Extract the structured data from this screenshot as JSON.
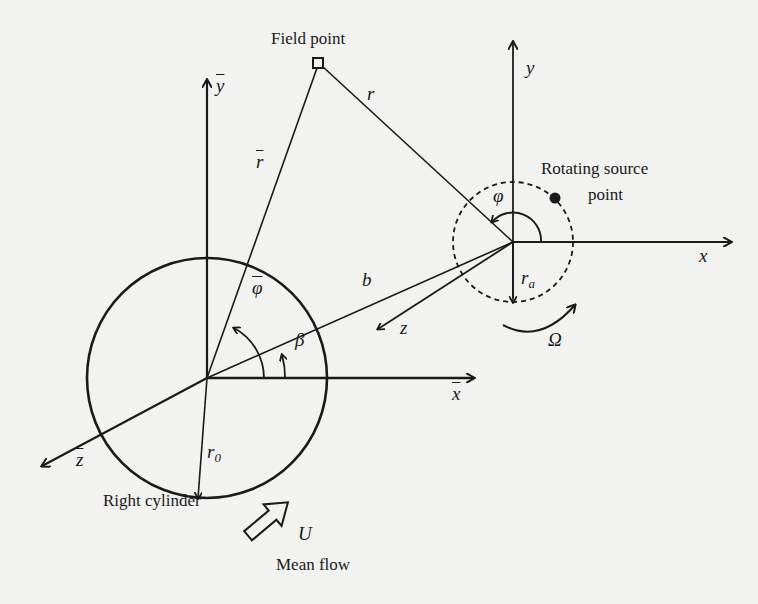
{
  "figure": {
    "type": "geometry-diagram",
    "labels": {
      "field_point": "Field point",
      "rotating_source_line1": "Rotating source",
      "rotating_source_line2": "point",
      "right_cylinder": "Right cylinder",
      "mean_flow": "Mean flow",
      "y_bar": "y",
      "x_bar": "x",
      "z_bar": "z",
      "r_bar": "r",
      "phi_bar": "φ",
      "beta": "β",
      "b": "b",
      "r": "r",
      "y": "y",
      "x": "x",
      "z": "z",
      "phi": "φ",
      "r_a_base": "r",
      "r_a_sub": "a",
      "r_0_base": "r",
      "r_0_sub": "0",
      "omega": "Ω",
      "U": "U"
    },
    "colors": {
      "ink": "#1a1a1a",
      "paper": "#f2f2f0"
    }
  }
}
